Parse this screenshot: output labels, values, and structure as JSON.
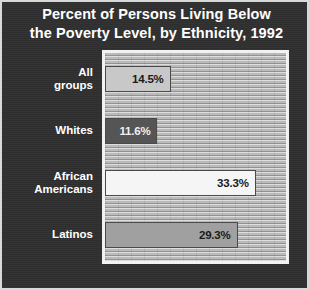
{
  "chart_data": {
    "type": "bar",
    "orientation": "horizontal",
    "title": "Percent of Persons Living Below the Poverty Level, by Ethnicity, 1992",
    "title_lines": [
      "Percent of Persons Living Below",
      "the Poverty Level, by Ethnicity, 1992"
    ],
    "xlabel": "",
    "ylabel": "",
    "xlim": [
      0,
      40
    ],
    "grid": false,
    "legend": "none",
    "categories": [
      "All groups",
      "Whites",
      "African Americans",
      "Latinos"
    ],
    "category_lines": [
      [
        "All",
        "groups"
      ],
      [
        "Whites"
      ],
      [
        "African",
        "Americans"
      ],
      [
        "Latinos"
      ]
    ],
    "values": [
      14.5,
      11.6,
      33.3,
      29.3
    ],
    "value_labels": [
      "14.5%",
      "11.6%",
      "33.3%",
      "29.3%"
    ],
    "bar_colors": [
      "#c8c8c8",
      "#555555",
      "#f5f5f5",
      "#a0a0a0"
    ],
    "value_label_colors": [
      "#1a1a1a",
      "#f0f0f0",
      "#1a1a1a",
      "#1a1a1a"
    ]
  },
  "style": {
    "background": "#2f2f2f",
    "frame_border": "#d8d8d8",
    "plot_border": "#f2f2f2",
    "plot_background": "#b4b4b4",
    "title_color": "#ffffff",
    "category_label_color": "#ffffff"
  }
}
